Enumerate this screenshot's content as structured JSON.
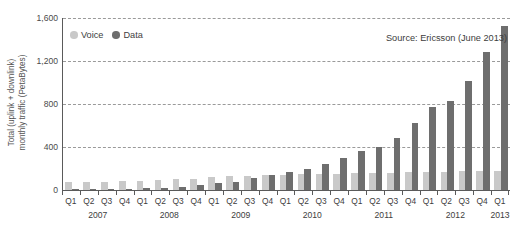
{
  "chart_data": {
    "type": "bar",
    "title": "",
    "subtitle": "",
    "xlabel": "",
    "ylabel": "Total (uplink + downlink)\nmonthly traffic (PetaBytes)",
    "ylim": [
      0,
      1600
    ],
    "yticks": [
      0,
      400,
      800,
      1200,
      1600
    ],
    "ytick_labels": [
      "0",
      "400",
      "800",
      "1,200",
      "1,600"
    ],
    "grid": "horizontal-dashed",
    "legend_position": "top-left-inside",
    "annotation": "Source: Ericsson (June 2013)",
    "categories": [
      "Q1",
      "Q2",
      "Q3",
      "Q4",
      "Q1",
      "Q2",
      "Q3",
      "Q4",
      "Q1",
      "Q2",
      "Q3",
      "Q4",
      "Q1",
      "Q2",
      "Q3",
      "Q4",
      "Q1",
      "Q2",
      "Q3",
      "Q4",
      "Q1",
      "Q2",
      "Q3",
      "Q4",
      "Q1"
    ],
    "year_groups": [
      {
        "label": "2007",
        "start": 0,
        "count": 4
      },
      {
        "label": "2008",
        "start": 4,
        "count": 4
      },
      {
        "label": "2009",
        "start": 8,
        "count": 4
      },
      {
        "label": "2010",
        "start": 12,
        "count": 4
      },
      {
        "label": "2011",
        "start": 16,
        "count": 4
      },
      {
        "label": "2012",
        "start": 20,
        "count": 4
      },
      {
        "label": "2013",
        "start": 24,
        "count": 1
      }
    ],
    "series": [
      {
        "name": "Voice",
        "color": "#c9c9c9",
        "values": [
          70,
          72,
          78,
          82,
          88,
          95,
          100,
          105,
          118,
          128,
          130,
          138,
          142,
          148,
          150,
          152,
          158,
          160,
          162,
          165,
          170,
          172,
          174,
          176,
          178
        ]
      },
      {
        "name": "Data",
        "color": "#6e6e6e",
        "values": [
          3,
          5,
          8,
          14,
          18,
          22,
          32,
          44,
          62,
          78,
          108,
          140,
          168,
          198,
          238,
          300,
          365,
          400,
          480,
          620,
          770,
          830,
          1010,
          1280,
          1530
        ]
      }
    ]
  },
  "legend": {
    "items": [
      {
        "label": "Voice"
      },
      {
        "label": "Data"
      }
    ]
  },
  "icons": {
    "voice_swatch": "circle-icon",
    "data_swatch": "circle-icon"
  }
}
